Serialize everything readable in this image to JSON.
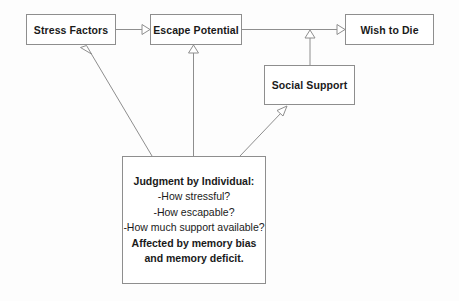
{
  "diagram": {
    "background_color": "#fdfdfd",
    "line_color": "#8e8e8e",
    "text_color": "#1a1a1a",
    "nodes": [
      {
        "id": "stress",
        "label": "Stress Factors"
      },
      {
        "id": "escape",
        "label": "Escape Potential"
      },
      {
        "id": "wish",
        "label": "Wish to Die"
      },
      {
        "id": "social",
        "label": "Social Support"
      }
    ],
    "judgment_box": {
      "lines": [
        {
          "text": "Judgment by Individual:",
          "bold": true
        },
        {
          "text": "-How stressful?",
          "bold": false
        },
        {
          "text": "-How escapable?",
          "bold": false
        },
        {
          "text": "-How much support available?",
          "bold": false
        },
        {
          "text": "Affected by memory bias",
          "bold": true
        },
        {
          "text": "and memory deficit.",
          "bold": true
        }
      ]
    },
    "edges": [
      {
        "id": "stress-to-escape",
        "from": "Stress Factors",
        "to": "Escape Potential",
        "arrowhead": "open-triangle"
      },
      {
        "id": "escape-to-wish",
        "from": "Escape Potential",
        "to": "Wish to Die",
        "arrowhead": "open-triangle"
      },
      {
        "id": "social-to-escape-wish",
        "from": "Social Support",
        "to": "Escape Potential to Wish to Die link",
        "arrowhead": "open-triangle"
      },
      {
        "id": "judgment-to-stress",
        "from": "Judgment by Individual",
        "to": "Stress Factors",
        "arrowhead": "open-triangle"
      },
      {
        "id": "judgment-to-escape",
        "from": "Judgment by Individual",
        "to": "Escape Potential",
        "arrowhead": "open-triangle"
      },
      {
        "id": "judgment-to-social",
        "from": "Judgment by Individual",
        "to": "Social Support",
        "arrowhead": "open-triangle"
      }
    ]
  }
}
